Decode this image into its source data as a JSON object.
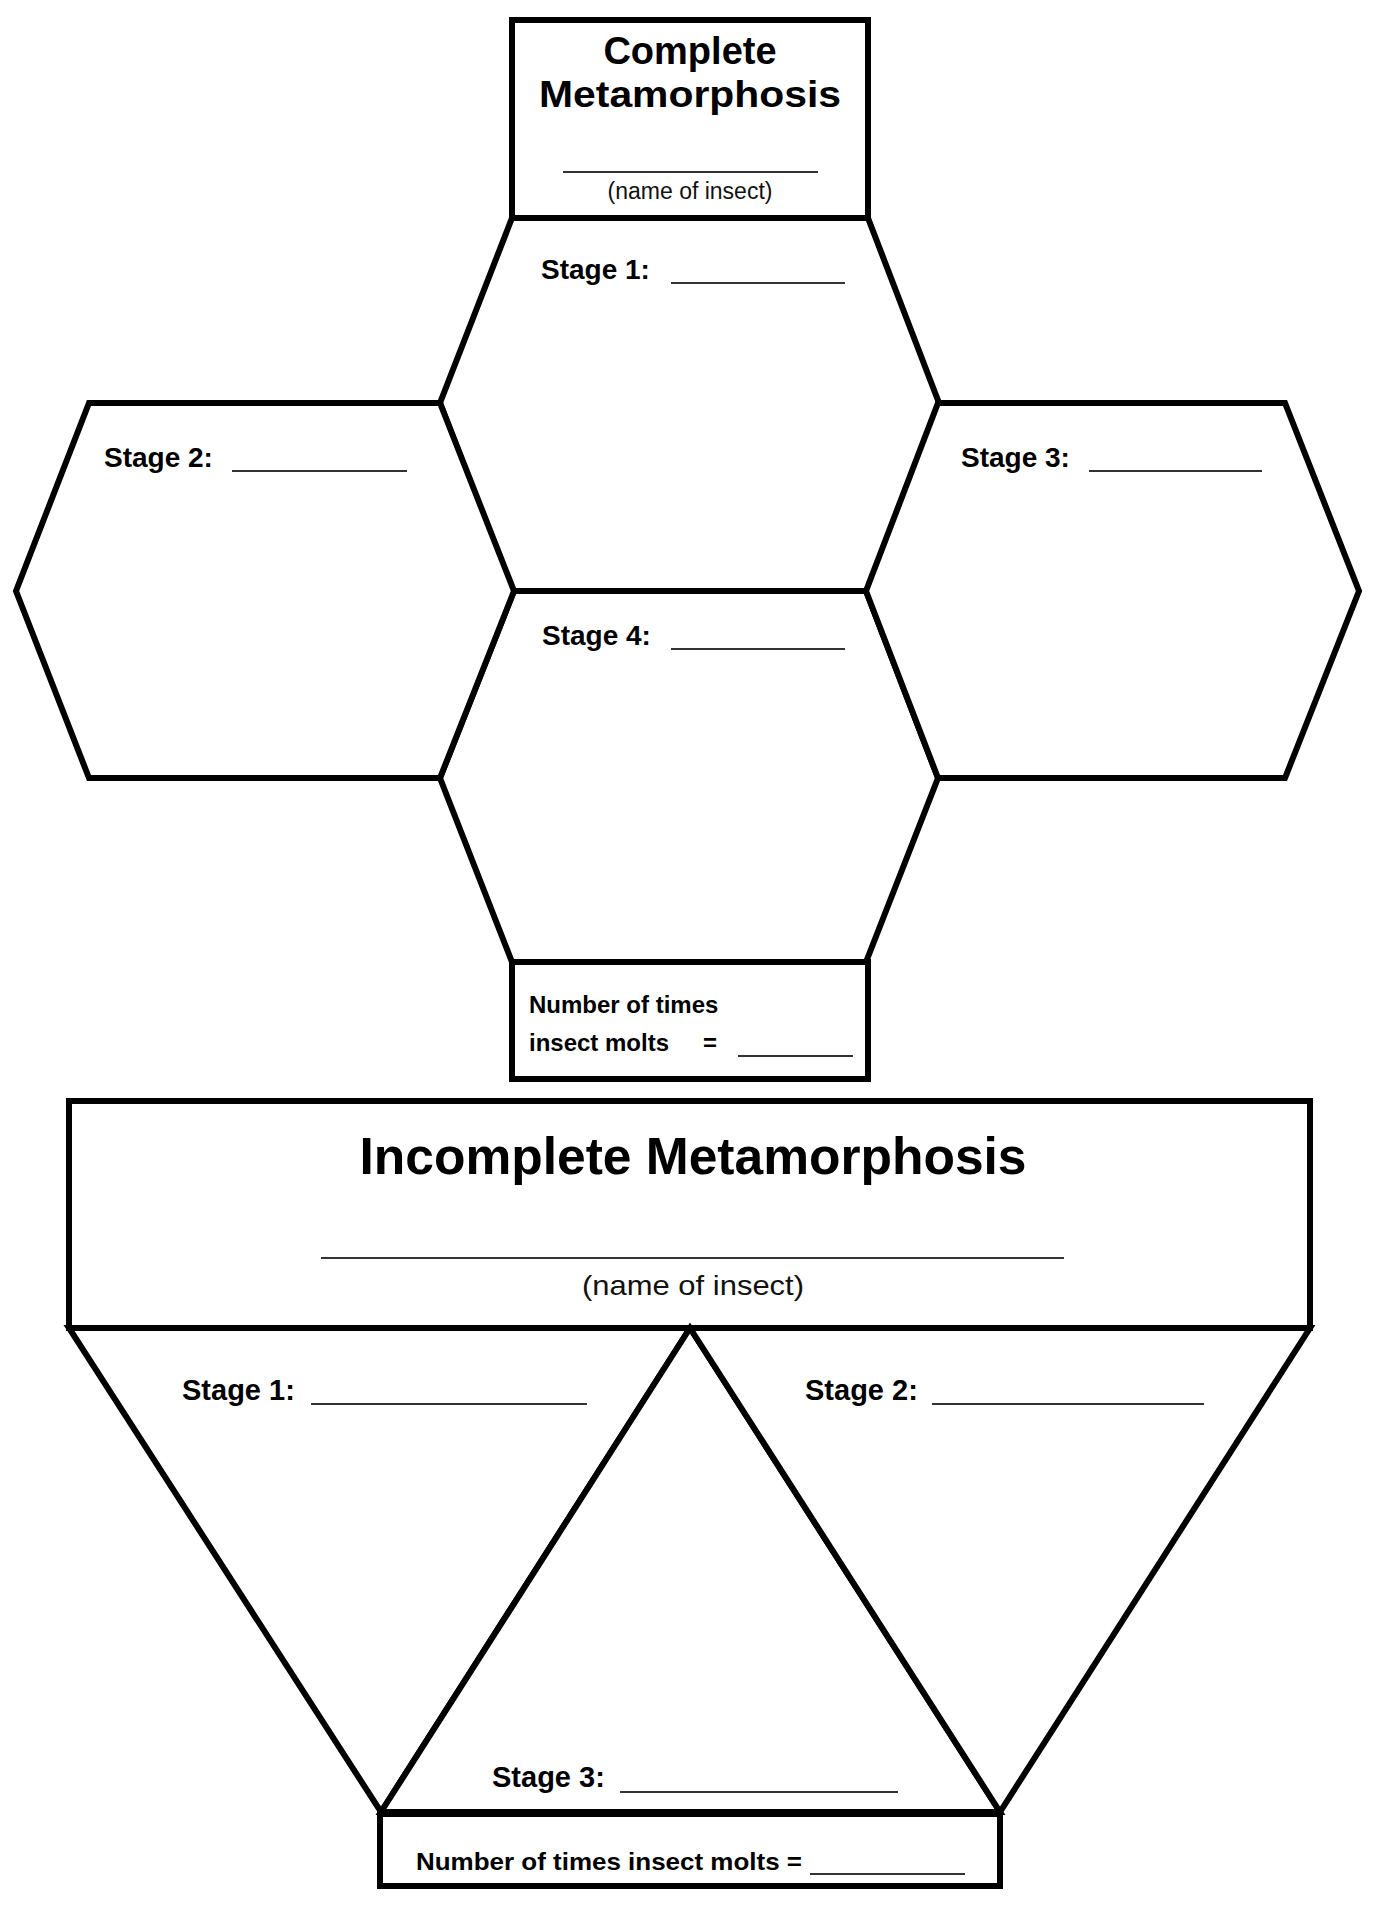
{
  "page": {
    "background": "#ffffff",
    "line_color": "#000000"
  },
  "complete": {
    "title_line1": "Complete",
    "title_line2": "Metamorphosis",
    "name_caption": "(name of insect)",
    "stages": [
      {
        "label": "Stage 1:"
      },
      {
        "label": "Stage 2:"
      },
      {
        "label": "Stage 3:"
      },
      {
        "label": "Stage 4:"
      }
    ],
    "molts_line1": "Number of times",
    "molts_line2": "insect molts",
    "molts_equals": "="
  },
  "incomplete": {
    "title": "Incomplete Metamorphosis",
    "name_caption": "(name of insect)",
    "stages": [
      {
        "label": "Stage 1:"
      },
      {
        "label": "Stage 2:"
      },
      {
        "label": "Stage 3:"
      }
    ],
    "molts_text": "Number of times insect molts ="
  }
}
